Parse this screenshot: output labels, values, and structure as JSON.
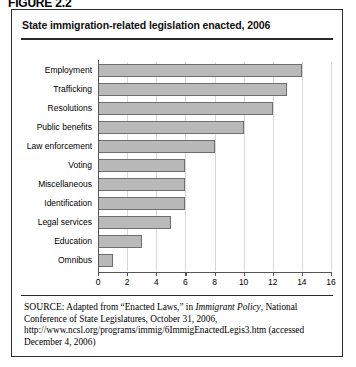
{
  "figure": {
    "label": "FIGURE 2.2",
    "title": "State immigration-related legislation enacted, 2006"
  },
  "source": {
    "prefix": "SOURCE:",
    "text_before_italic": " Adapted from “Enacted Laws,” in ",
    "italic_title": "Immigrant Policy",
    "text_after_italic": ", National Conference of State Legislatures, October 31, 2006, http://www.ncsl.org/programs/immig/6ImmigEnactedLegis3.htm (accessed December 4, 2006)"
  },
  "chart_data": {
    "type": "bar",
    "orientation": "horizontal",
    "title": "State immigration-related legislation enacted, 2006",
    "xlabel": "",
    "ylabel": "",
    "xlim": [
      0,
      16
    ],
    "xticks": [
      0,
      2,
      4,
      6,
      8,
      10,
      12,
      14,
      16
    ],
    "grid": true,
    "legend": false,
    "categories": [
      "Employment",
      "Trafficking",
      "Resolutions",
      "Public benefits",
      "Law enforcement",
      "Voting",
      "Miscellaneous",
      "Identification",
      "Legal services",
      "Education",
      "Omnibus"
    ],
    "values": [
      14,
      13,
      12,
      10,
      8,
      6,
      6,
      6,
      5,
      3,
      1
    ],
    "bar_color": "#b9b9b9",
    "bar_edge_color": "#6e6e6e"
  }
}
